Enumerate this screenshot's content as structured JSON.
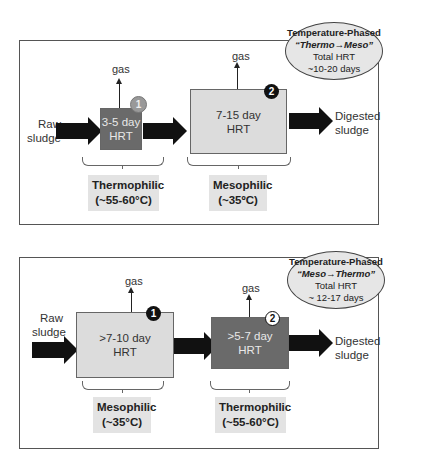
{
  "diagram": {
    "top_cutoff_text": "",
    "panels": [
      {
        "id": "thermo-meso",
        "summary": {
          "line1": "Temperature-Phased",
          "line2": "“Thermo→Meso”",
          "line3": "Total HRT",
          "line4": "~10-20 days"
        },
        "input_label": [
          "Raw",
          "sludge"
        ],
        "output_label": [
          "Digested",
          "sludge"
        ],
        "stages": [
          {
            "number": "1",
            "hrt_line1": "3-5 day",
            "hrt_line2": "HRT",
            "gas": "gas",
            "type_label": "Thermophilic",
            "temp_label": "(~55-60°C)"
          },
          {
            "number": "2",
            "hrt_line1": "7-15 day",
            "hrt_line2": "HRT",
            "gas": "gas",
            "type_label": "Mesophilic",
            "temp_label": "(~35ºC)"
          }
        ]
      },
      {
        "id": "meso-thermo",
        "summary": {
          "line1": "Temperature-Phased",
          "line2": "“Meso→Thermo”",
          "line3": "Total HRT",
          "line4": "~ 12-17 days"
        },
        "input_label": [
          "Raw",
          "sludge"
        ],
        "output_label": [
          "Digested",
          "sludge"
        ],
        "stages": [
          {
            "number": "1",
            "hrt_line1": ">7-10 day",
            "hrt_line2": "HRT",
            "gas": "gas",
            "type_label": "Mesophilic",
            "temp_label": "(~35°C)"
          },
          {
            "number": "2",
            "hrt_line1": ">5-7 day",
            "hrt_line2": "HRT",
            "gas": "gas",
            "type_label": "Thermophilic",
            "temp_label": "(~55-60°C)"
          }
        ]
      }
    ],
    "colors": {
      "thermophilic_reactor": "#6a6a6a",
      "mesophilic_reactor": "#dcdcdc",
      "arrow": "#111111",
      "label_box": "#e3e3e3"
    }
  }
}
